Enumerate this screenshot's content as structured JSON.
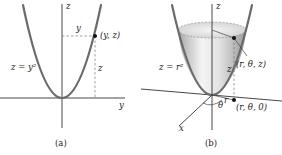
{
  "panel_a": {
    "caption": "(a)",
    "axis_z_label": "z",
    "axis_y_label": "y",
    "curve_label": "z = y²",
    "point_label": "(y, z)",
    "horizontal_dim_label": "y",
    "vertical_dim_label": "z"
  },
  "panel_b": {
    "caption": "(b)",
    "axis_z_label": "z",
    "axis_x_label": "x",
    "surface_label": "z = r²",
    "point_label": "(r, θ, z)",
    "base_point_label": "(r, θ, 0)",
    "angle_label": "θ",
    "radius_label": "r",
    "vertical_dim_label": "z"
  },
  "colors": {
    "curve": "#6a6a6a",
    "axis": "#333333",
    "surface_light": "#f2f2f2",
    "surface_dark": "#a8a8a8",
    "point": "#111111"
  }
}
